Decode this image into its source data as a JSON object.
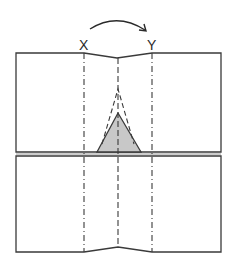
{
  "diagram": {
    "type": "origami-fold-step",
    "labels": {
      "left_point": "X",
      "right_point": "Y"
    },
    "colors": {
      "line": "#3a3a3a",
      "fill_triangle": "#c8c8c8",
      "paper": "#ffffff"
    },
    "elements": [
      {
        "name": "curved-arrow",
        "from": "X",
        "to": "Y",
        "meaning": "fold X over to Y"
      },
      {
        "name": "upper-panel",
        "shape": "rectangle with shallow V notch at top center"
      },
      {
        "name": "lower-panel",
        "shape": "rectangle with shallow peak at bottom center"
      },
      {
        "name": "fold-line-x",
        "style": "dash-dot (mountain)"
      },
      {
        "name": "fold-line-center",
        "style": "dashed (valley)"
      },
      {
        "name": "fold-line-y",
        "style": "dash-dot (mountain)"
      },
      {
        "name": "shaded-triangle",
        "style": "gray fill, solid outline"
      },
      {
        "name": "dashed-triangle",
        "style": "dashed outline above shaded triangle"
      }
    ]
  }
}
